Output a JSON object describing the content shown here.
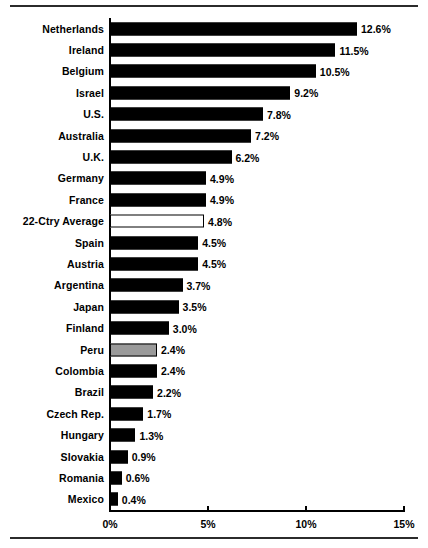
{
  "chart_data": {
    "type": "bar",
    "orientation": "horizontal",
    "title": "",
    "subtitle": "",
    "xlabel": "",
    "ylabel": "",
    "xlim": [
      0,
      15
    ],
    "grid": false,
    "legend": null,
    "axis": {
      "ticks": [
        0,
        5,
        10,
        15
      ],
      "tick_labels": [
        "0%",
        "5%",
        "10%",
        "15%"
      ]
    },
    "categories": [
      "Netherlands",
      "Ireland",
      "Belgium",
      "Israel",
      "U.S.",
      "Australia",
      "U.K.",
      "Germany",
      "France",
      "22-Ctry Average",
      "Spain",
      "Austria",
      "Argentina",
      "Japan",
      "Finland",
      "Peru",
      "Colombia",
      "Brazil",
      "Czech Rep.",
      "Hungary",
      "Slovakia",
      "Romania",
      "Mexico"
    ],
    "values": [
      12.6,
      11.5,
      10.5,
      9.2,
      7.8,
      7.2,
      6.2,
      4.9,
      4.9,
      4.8,
      4.5,
      4.5,
      3.7,
      3.5,
      3.0,
      2.4,
      2.4,
      2.2,
      1.7,
      1.3,
      0.9,
      0.6,
      0.4
    ],
    "value_labels": [
      "12.6%",
      "11.5%",
      "10.5%",
      "9.2%",
      "7.8%",
      "7.2%",
      "6.2%",
      "4.9%",
      "4.9%",
      "4.8%",
      "4.5%",
      "4.5%",
      "3.7%",
      "3.5%",
      "3.0%",
      "2.4%",
      "2.4%",
      "2.2%",
      "1.7%",
      "1.3%",
      "0.9%",
      "0.6%",
      "0.4%"
    ],
    "bar_styles": [
      "black",
      "black",
      "black",
      "black",
      "black",
      "black",
      "black",
      "black",
      "black",
      "white",
      "black",
      "black",
      "black",
      "black",
      "black",
      "gray",
      "black",
      "black",
      "black",
      "black",
      "black",
      "black",
      "black"
    ],
    "colors": {
      "bar_black": "#000000",
      "bar_gray": "#9a9a9a",
      "bar_white": "#ffffff",
      "outline": "#000000",
      "axis": "#000000",
      "text": "#000000",
      "background": "#ffffff",
      "rule": "#2b2b2b"
    }
  }
}
